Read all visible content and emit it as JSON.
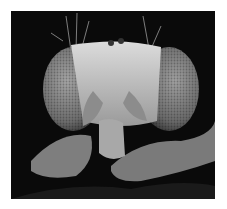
{
  "image": {
    "subject": "scanning electron micrograph of a fly head (front view)",
    "alt": "SEM image of a fruit fly head with compound eyes, antennae and mouthparts",
    "colors": {
      "background": "#0a0a0a",
      "eye": "#8a8a8a",
      "face": "#c8c8c8",
      "border": "#ffffff"
    }
  }
}
